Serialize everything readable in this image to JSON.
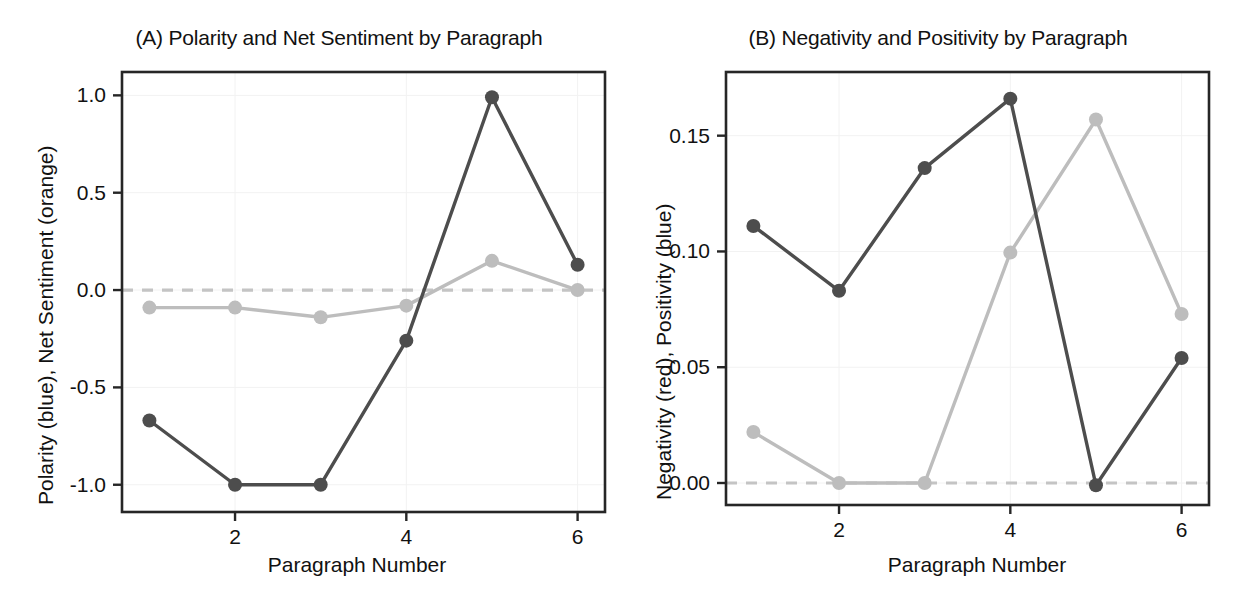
{
  "figure": {
    "background": "#ffffff",
    "dark_series_color": "#4d4d4d",
    "light_series_color": "#bdbdbd",
    "zero_line_color": "#c4c4c4",
    "axis_color": "#262626",
    "grid_color": "#f2f2f2"
  },
  "panels": [
    {
      "id": "A",
      "title": "(A) Polarity and Net Sentiment by Paragraph",
      "ylabel": "Polarity (blue), Net Sentiment (orange)",
      "xlabel": "Paragraph Number",
      "ytick_labels": [
        "1.0",
        "0.5",
        "0.0",
        "-0.5",
        "-1.0"
      ],
      "xtick_labels": [
        "2",
        "4",
        "6"
      ]
    },
    {
      "id": "B",
      "title": "(B) Negativity and Positivity by Paragraph",
      "ylabel": "Negativity (red), Positivity (blue)",
      "xlabel": "Paragraph Number",
      "ytick_labels": [
        "0.15",
        "0.10",
        "0.05",
        "0.00"
      ],
      "xtick_labels": [
        "2",
        "4",
        "6"
      ]
    }
  ],
  "chart_data": [
    {
      "type": "line",
      "panel": "A",
      "title": "(A) Polarity and Net Sentiment by Paragraph",
      "xlabel": "Paragraph Number",
      "ylabel": "Polarity (blue), Net Sentiment (orange)",
      "x": [
        1,
        2,
        3,
        4,
        5,
        6
      ],
      "xticks": [
        2,
        4,
        6
      ],
      "yticks": [
        1.0,
        0.5,
        0.0,
        -0.5,
        -1.0
      ],
      "xlim": [
        0.68,
        6.32
      ],
      "ylim": [
        -1.14,
        1.12
      ],
      "grid": true,
      "legend": "none",
      "reference_line": {
        "y": 0.0,
        "style": "dashed",
        "color": "#c4c4c4"
      },
      "series": [
        {
          "name": "Polarity (blue)",
          "color": "#4d4d4d",
          "marker": "circle",
          "values": [
            -0.67,
            -1.0,
            -1.0,
            -0.26,
            0.99,
            0.13
          ]
        },
        {
          "name": "Net Sentiment (orange)",
          "color": "#bdbdbd",
          "marker": "circle",
          "values": [
            -0.09,
            -0.09,
            -0.14,
            -0.08,
            0.15,
            0.0
          ]
        }
      ]
    },
    {
      "type": "line",
      "panel": "B",
      "title": "(B) Negativity and Positivity by Paragraph",
      "xlabel": "Paragraph Number",
      "ylabel": "Negativity (red), Positivity (blue)",
      "x": [
        1,
        2,
        3,
        4,
        5,
        6
      ],
      "xticks": [
        2,
        4,
        6
      ],
      "yticks": [
        0.15,
        0.1,
        0.05,
        0.0
      ],
      "xlim": [
        0.68,
        6.32
      ],
      "ylim": [
        -0.0095,
        0.1775
      ],
      "grid": true,
      "legend": "none",
      "reference_line": {
        "y": 0.0,
        "style": "dashed",
        "color": "#c4c4c4"
      },
      "series": [
        {
          "name": "Negativity (red)",
          "color": "#4d4d4d",
          "marker": "circle",
          "values": [
            0.111,
            0.083,
            0.136,
            0.166,
            -0.001,
            0.054
          ]
        },
        {
          "name": "Positivity (blue)",
          "color": "#bdbdbd",
          "marker": "circle",
          "values": [
            0.022,
            0.0,
            0.0,
            0.0995,
            0.157,
            0.073
          ]
        }
      ]
    }
  ]
}
